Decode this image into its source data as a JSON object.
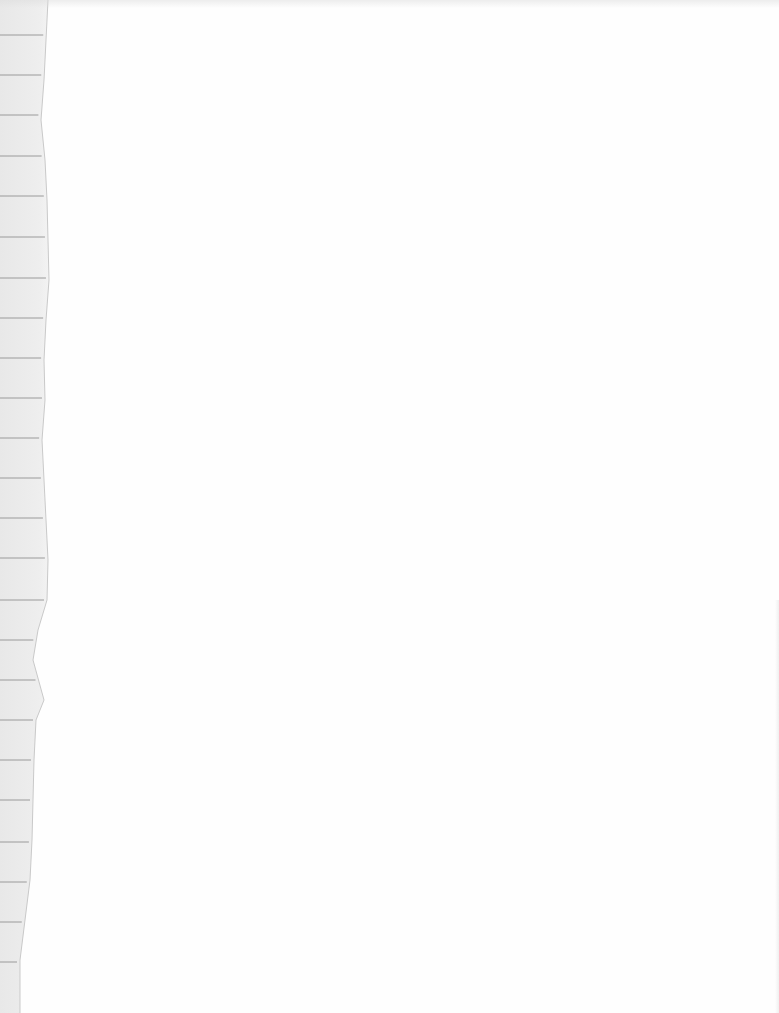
{
  "scene": {
    "description": "Blank white sheet with a torn strip of lined notebook paper along the left edge",
    "background_color": "#fefefe",
    "paper_strip": {
      "fill_color": "#ebebeb",
      "edge_color": "#c9c9c9",
      "rule_color": "#9a9a9a",
      "rule_y_positions": [
        35,
        75,
        115,
        156,
        196,
        237,
        278,
        318,
        358,
        398,
        438,
        478,
        518,
        558,
        600,
        640,
        680,
        720,
        760,
        800,
        842,
        882,
        922,
        962
      ],
      "torn_edge_points": [
        [
          48,
          0
        ],
        [
          46,
          40
        ],
        [
          44,
          80
        ],
        [
          41,
          120
        ],
        [
          45,
          160
        ],
        [
          47,
          200
        ],
        [
          48,
          240
        ],
        [
          49,
          280
        ],
        [
          46,
          320
        ],
        [
          44,
          360
        ],
        [
          45,
          400
        ],
        [
          42,
          440
        ],
        [
          44,
          480
        ],
        [
          46,
          520
        ],
        [
          48,
          560
        ],
        [
          47,
          600
        ],
        [
          38,
          630
        ],
        [
          33,
          660
        ],
        [
          44,
          700
        ],
        [
          36,
          720
        ],
        [
          34,
          760
        ],
        [
          33,
          800
        ],
        [
          32,
          840
        ],
        [
          30,
          880
        ],
        [
          25,
          920
        ],
        [
          20,
          960
        ],
        [
          20,
          1013
        ]
      ]
    }
  }
}
